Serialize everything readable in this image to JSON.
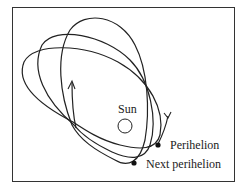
{
  "diagram": {
    "labels": {
      "sun": "Sun",
      "perihelion": "Perihelion",
      "next_perihelion": "Next perihelion"
    },
    "colors": {
      "line": "#222222",
      "background": "#ffffff"
    }
  }
}
